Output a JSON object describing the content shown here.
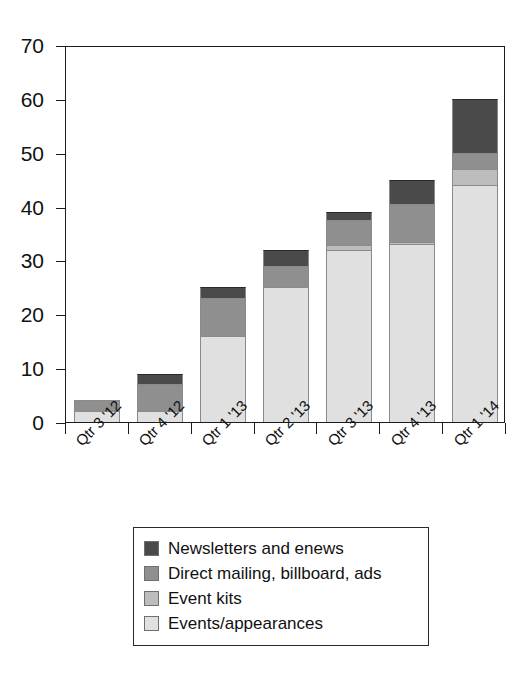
{
  "chart_data": {
    "type": "bar",
    "stacked": true,
    "title": "",
    "subtitle": "",
    "xlabel": "",
    "ylabel": "",
    "ylim": [
      0,
      70
    ],
    "yticks": [
      0,
      10,
      20,
      30,
      40,
      50,
      60,
      70
    ],
    "ytick_labels": [
      "0",
      "10",
      "20",
      "30",
      "40",
      "50",
      "60",
      "70"
    ],
    "grid": false,
    "legend_position": "bottom",
    "categories": [
      "Qtr 3 '12",
      "Qtr 4 '12",
      "Qtr 1 '13",
      "Qtr 2 '13",
      "Qtr 3 '13",
      "Qtr 4 '13",
      "Qtr 1 '14"
    ],
    "series": [
      {
        "name": "Events/appearances",
        "color": "#e0e0e0",
        "values": [
          2,
          2,
          16,
          25,
          32,
          33,
          44
        ]
      },
      {
        "name": "Event kits",
        "color": "#bdbdbd",
        "values": [
          0,
          0,
          0,
          0,
          0.8,
          0.5,
          3
        ]
      },
      {
        "name": "Direct mailing, billboard, ads",
        "color": "#8f8f8f",
        "values": [
          2,
          5,
          7,
          4,
          4.7,
          7,
          3
        ]
      },
      {
        "name": "Newsletters and enews",
        "color": "#4a4a4a",
        "values": [
          0,
          2,
          2,
          3,
          1.5,
          4.5,
          10
        ]
      }
    ],
    "totals": [
      4,
      9,
      25,
      32,
      39,
      45,
      60
    ],
    "legend": [
      {
        "label": "Newsletters and enews",
        "color": "#4a4a4a"
      },
      {
        "label": "Direct mailing, billboard, ads",
        "color": "#8f8f8f"
      },
      {
        "label": "Event kits",
        "color": "#bdbdbd"
      },
      {
        "label": "Events/appearances",
        "color": "#e0e0e0"
      }
    ]
  }
}
